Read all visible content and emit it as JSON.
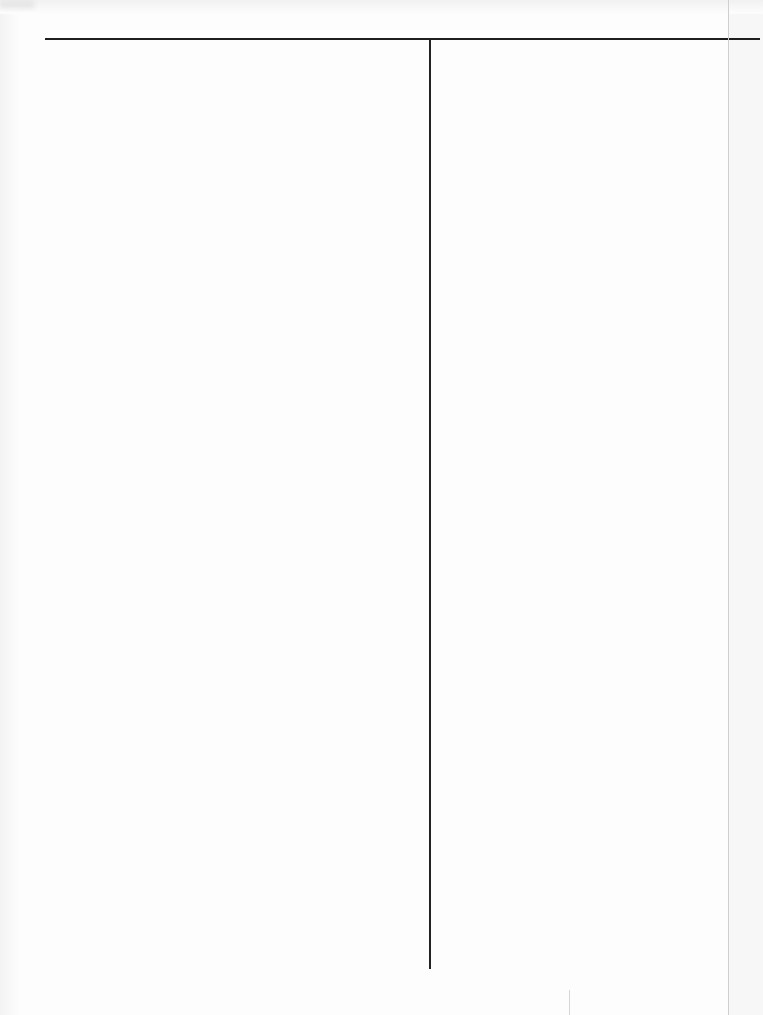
{
  "page": {
    "type": "blank-scanned-form",
    "layout": "two-column-ruled",
    "colors": {
      "background": "#fdfdfd",
      "rule": "#1e1e1e",
      "edge": "#cfcfcf"
    },
    "columns": [
      {
        "name": "left-column",
        "text": ""
      },
      {
        "name": "right-column",
        "text": ""
      }
    ]
  }
}
